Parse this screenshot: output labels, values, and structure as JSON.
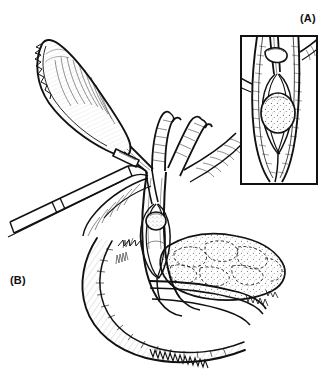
{
  "figure": {
    "background_color": "#ffffff",
    "ink_color": "#111111",
    "width": 332,
    "height": 378
  },
  "panels": [
    {
      "id": "A",
      "label": "(A)",
      "role": "inset-closeup",
      "caption_text": "(A)",
      "description": "Close-up inset of the common bile duct lumen with the wire basket opened around a stone",
      "frame": {
        "x": 240,
        "y": 35,
        "width": 78,
        "height": 150,
        "border_color": "#111111",
        "border_width": 2
      },
      "contents": [
        "duct-wall-longitudinal",
        "catheter-sheath",
        "catheter-hub-collar",
        "wire-basket-open",
        "captured-stone-stippled",
        "side-branch-duct"
      ]
    },
    {
      "id": "B",
      "label": "(B)",
      "role": "main-operative-view",
      "caption_text": "(B)",
      "description": "Operative field: gallbladder retracted superolaterally, clip on cystic duct, laparoscopic grasper, hepatic duct confluence, basket with stone within the common bile duct, duodenal C-loop and pancreas",
      "contents": [
        "gallbladder",
        "cystic-duct",
        "surgical-clip",
        "laparoscopic-instrument",
        "hepatic-duct-branches",
        "common-bile-duct",
        "wire-basket",
        "bile-duct-stone",
        "duodenum",
        "pancreas"
      ]
    }
  ],
  "anatomy": {
    "gallbladder": {
      "name": "Gallbladder",
      "shading": "hatched-lines"
    },
    "cystic_duct": {
      "name": "Cystic duct"
    },
    "common_bile_duct": {
      "name": "Common bile duct"
    },
    "hepatic_ducts": {
      "name": "Right and left hepatic ducts"
    },
    "duodenum": {
      "name": "Duodenum",
      "shading": "fine-hatching"
    },
    "pancreas": {
      "name": "Pancreas",
      "shading": "lobulated-stipple"
    }
  },
  "instruments": {
    "basket": {
      "name": "Wire retrieval basket",
      "state": "open-around-stone"
    },
    "catheter": {
      "name": "Transcystic catheter sheath"
    },
    "clip": {
      "name": "Surgical clip on cystic duct"
    },
    "grasper": {
      "name": "Laparoscopic grasper / instrument shaft"
    }
  },
  "pathology": {
    "stone": {
      "name": "Bile duct stone (choledocholithiasis)",
      "shape": "round",
      "fill": "stippled"
    }
  },
  "style": {
    "type": "black-and-white line drawing",
    "line_color": "#111111",
    "fill_color": "#ffffff",
    "stipple_color": "#444444"
  }
}
